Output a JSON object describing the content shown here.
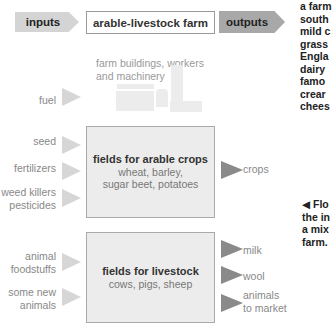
{
  "header": {
    "inputs_label": "inputs",
    "title": "arable-livestock farm",
    "outputs_label": "outputs"
  },
  "farm_buildings": {
    "label_line1": "farm buildings, workers",
    "label_line2": "and machinery",
    "input": "fuel"
  },
  "arable": {
    "title": "fields for arable crops",
    "line1": "wheat, barley,",
    "line2": "sugar beet, potatoes",
    "inputs": [
      {
        "line1": "seed",
        "line2": ""
      },
      {
        "line1": "fertilizers",
        "line2": ""
      },
      {
        "line1": "weed killers",
        "line2": "pesticides"
      }
    ],
    "outputs": [
      {
        "line1": "crops",
        "line2": ""
      }
    ]
  },
  "livestock": {
    "title": "fields for livestock",
    "line1": "cows, pigs, sheep",
    "inputs": [
      {
        "line1": "animal",
        "line2": "foodstuffs"
      },
      {
        "line1": "some new",
        "line2": "animals"
      }
    ],
    "outputs": [
      {
        "line1": "milk",
        "line2": ""
      },
      {
        "line1": "wool",
        "line2": ""
      },
      {
        "line1": "animals",
        "line2": "to market"
      }
    ]
  },
  "side_text_top": [
    "a farm",
    "south",
    "mild c",
    "grass",
    "Engla",
    "dairy",
    "famo",
    "crear",
    "chees"
  ],
  "side_caption": [
    "◀ Flo",
    "the in",
    "a mix",
    "farm."
  ],
  "colors": {
    "input_arrow": "#d6d6d6",
    "output_arrow": "#8a8a8a",
    "box_fill": "#ececec",
    "header_input": "#d4d4d4",
    "header_output": "#a8a8a8"
  }
}
